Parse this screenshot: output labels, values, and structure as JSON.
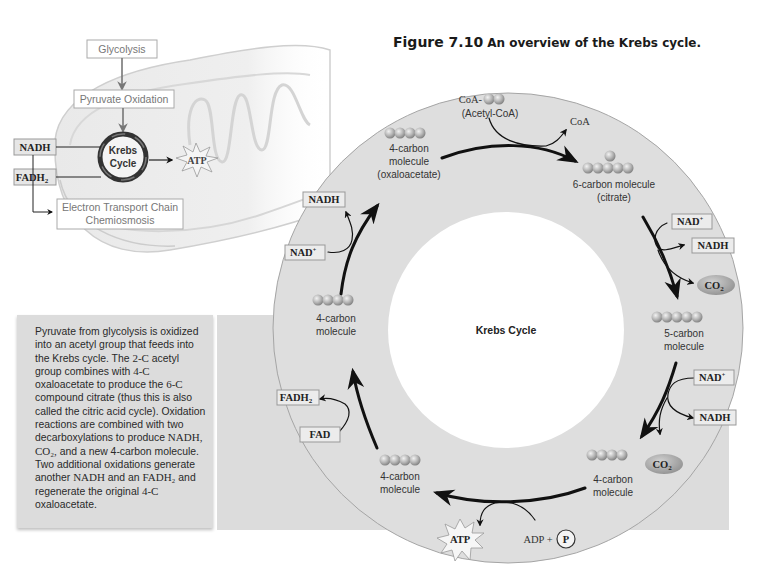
{
  "figure": {
    "number": "Figure 7.10",
    "caption": "An overview of the Krebs cycle."
  },
  "overview": {
    "glycolysis": "Glycolysis",
    "pyruvate_oxidation": "Pyruvate Oxidation",
    "krebs_line1": "Krebs",
    "krebs_line2": "Cycle",
    "atp": "ATP",
    "nadh": "NADH",
    "fadh2": "FADH",
    "fadh2_sub": "2",
    "etc_line1": "Electron Transport Chain",
    "etc_line2": "Chemiosmosis"
  },
  "description": {
    "parts": [
      {
        "t": "Pyruvate from glycolysis is oxidized into an acetyl group that feeds into the Krebs cycle. The ",
        "serif": false
      },
      {
        "t": "2-C",
        "serif": true
      },
      {
        "t": " acetyl group combines with ",
        "serif": false
      },
      {
        "t": "4-C",
        "serif": true
      },
      {
        "t": " oxaloacetate to produce the ",
        "serif": false
      },
      {
        "t": "6-C",
        "serif": true
      },
      {
        "t": " compound citrate (thus this is also called the citric acid cycle). Oxidation reactions are combined with two decarboxylations to produce ",
        "serif": false
      },
      {
        "t": "NADH, CO₂,",
        "serif": true
      },
      {
        "t": " and a new 4-carbon molecule. Two additional oxidations generate another ",
        "serif": false
      },
      {
        "t": "NADH",
        "serif": true
      },
      {
        "t": " and an ",
        "serif": false
      },
      {
        "t": "FADH₂",
        "serif": true
      },
      {
        "t": " and regenerate the original ",
        "serif": false
      },
      {
        "t": "4-C",
        "serif": true
      },
      {
        "t": " oxaloacetate.",
        "serif": false
      }
    ]
  },
  "cycle": {
    "center_label": "Krebs Cycle",
    "acetyl_coa_prefix": "CoA-",
    "acetyl_coa_name": "(Acetyl-CoA)",
    "coa_released": "CoA",
    "molecules": {
      "oxaloacetate": [
        "4-carbon",
        "molecule",
        "(oxaloacetate)"
      ],
      "citrate": [
        "6-carbon molecule",
        "(citrate)"
      ],
      "five_carbon": [
        "5-carbon",
        "molecule"
      ],
      "four_carbon_br": [
        "4-carbon",
        "molecule"
      ],
      "four_carbon_bottom": [
        "4-carbon",
        "molecule"
      ],
      "four_carbon_left": [
        "4-carbon",
        "molecule"
      ]
    },
    "cofactors": {
      "nad_plus": "NAD",
      "plus_sup": "+",
      "nadh": "NADH",
      "co2": "CO",
      "sub2": "2",
      "fad": "FAD",
      "fadh2": "FADH",
      "atp": "ATP",
      "adp_plus": "ADP +",
      "phosphate": "P"
    }
  },
  "colors": {
    "ring_fill": "#dedede",
    "ring_stroke": "#9a9a9a",
    "panel_gray": "#dcdcdc",
    "sphere_light": "#d8d8d8",
    "sphere_dark": "#8a8a8a",
    "arrow": "#111111"
  }
}
